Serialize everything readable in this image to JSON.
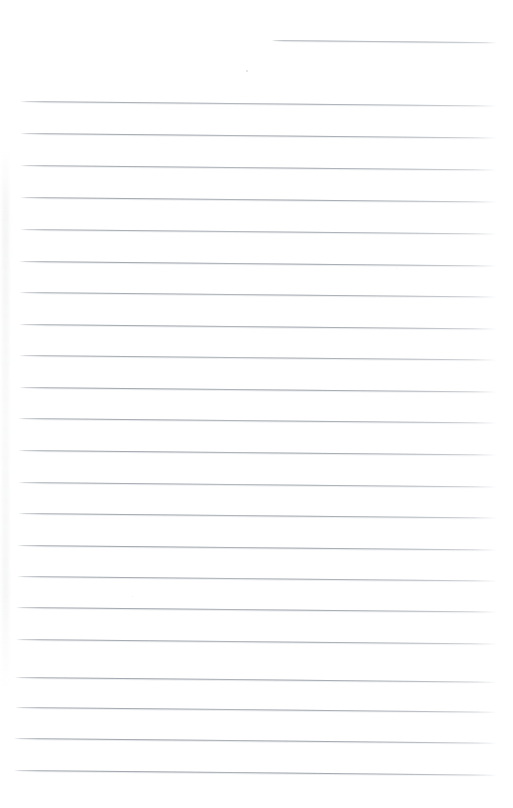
{
  "document": {
    "type": "scanned-lined-paper",
    "title": "Blank lined notebook page",
    "content_text": "",
    "page_width": 513,
    "page_height": 808,
    "background_color": "#ffffff",
    "rule_color": "#969ca4",
    "rule_thickness_px": 1,
    "rule_spacing_px": 31.8,
    "rule_left_x": 18,
    "rule_right_x": 497,
    "rule_slope_deg": 0.55,
    "total_rule_count": 23
  },
  "rules": [
    {
      "id": "rule-00",
      "y": 39.5,
      "x1": 272,
      "x2": 497,
      "partial": true,
      "opacity": 0.78
    },
    {
      "id": "rule-01",
      "y": 101.0,
      "x1": 20,
      "x2": 497,
      "partial": false,
      "opacity": 0.86
    },
    {
      "id": "rule-02",
      "y": 133.0,
      "x1": 20,
      "x2": 497,
      "partial": false,
      "opacity": 0.9
    },
    {
      "id": "rule-03",
      "y": 164.5,
      "x1": 20,
      "x2": 497,
      "partial": false,
      "opacity": 0.88
    },
    {
      "id": "rule-04",
      "y": 196.5,
      "x1": 20,
      "x2": 497,
      "partial": false,
      "opacity": 0.92
    },
    {
      "id": "rule-05",
      "y": 228.5,
      "x1": 20,
      "x2": 497,
      "partial": false,
      "opacity": 0.87
    },
    {
      "id": "rule-06",
      "y": 260.5,
      "x1": 19,
      "x2": 497,
      "partial": false,
      "opacity": 0.93
    },
    {
      "id": "rule-07",
      "y": 292.0,
      "x1": 19,
      "x2": 497,
      "partial": false,
      "opacity": 0.89
    },
    {
      "id": "rule-08",
      "y": 323.5,
      "x1": 19,
      "x2": 497,
      "partial": false,
      "opacity": 0.91
    },
    {
      "id": "rule-09",
      "y": 355.0,
      "x1": 19,
      "x2": 497,
      "partial": false,
      "opacity": 0.88
    },
    {
      "id": "rule-10",
      "y": 386.5,
      "x1": 19,
      "x2": 497,
      "partial": false,
      "opacity": 0.93
    },
    {
      "id": "rule-11",
      "y": 418.0,
      "x1": 18,
      "x2": 497,
      "partial": false,
      "opacity": 0.9
    },
    {
      "id": "rule-12",
      "y": 449.5,
      "x1": 18,
      "x2": 497,
      "partial": false,
      "opacity": 0.92
    },
    {
      "id": "rule-13",
      "y": 481.5,
      "x1": 18,
      "x2": 497,
      "partial": false,
      "opacity": 0.88
    },
    {
      "id": "rule-14",
      "y": 513.0,
      "x1": 18,
      "x2": 497,
      "partial": false,
      "opacity": 0.91
    },
    {
      "id": "rule-15",
      "y": 544.5,
      "x1": 17,
      "x2": 497,
      "partial": false,
      "opacity": 0.93
    },
    {
      "id": "rule-16",
      "y": 576.0,
      "x1": 17,
      "x2": 497,
      "partial": false,
      "opacity": 0.89
    },
    {
      "id": "rule-17",
      "y": 607.0,
      "x1": 16,
      "x2": 497,
      "partial": false,
      "opacity": 0.92
    },
    {
      "id": "rule-18",
      "y": 638.5,
      "x1": 16,
      "x2": 497,
      "partial": false,
      "opacity": 0.9
    },
    {
      "id": "rule-19",
      "y": 676.5,
      "x1": 15,
      "x2": 497,
      "partial": false,
      "opacity": 0.93
    },
    {
      "id": "rule-20",
      "y": 707.0,
      "x1": 15,
      "x2": 497,
      "partial": false,
      "opacity": 0.91
    },
    {
      "id": "rule-21",
      "y": 738.0,
      "x1": 14,
      "x2": 497,
      "partial": false,
      "opacity": 0.94
    },
    {
      "id": "rule-22",
      "y": 769.5,
      "x1": 14,
      "x2": 497,
      "partial": false,
      "opacity": 0.95
    }
  ],
  "artifacts": {
    "gutter_smudge": {
      "present": true,
      "x": 2,
      "y": 150,
      "width": 7,
      "height": 540
    },
    "specks": [
      {
        "id": "speck-1",
        "x": 246,
        "y": 70,
        "size": 1.6,
        "opacity": 0.3
      },
      {
        "id": "speck-2",
        "x": 132,
        "y": 596,
        "size": 1.2,
        "opacity": 0.18
      },
      {
        "id": "speck-3",
        "x": 396,
        "y": 268,
        "size": 1.1,
        "opacity": 0.16
      }
    ]
  }
}
